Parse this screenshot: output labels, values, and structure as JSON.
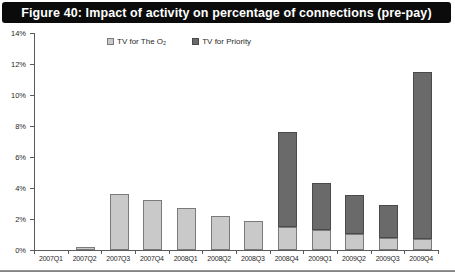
{
  "title": "Figure 40: Impact of activity on percentage of connections (pre-pay)",
  "chart_data": {
    "type": "bar",
    "stacked": true,
    "title": "Figure 40: Impact of activity on percentage of connections (pre-pay)",
    "categories": [
      "2007Q1",
      "2007Q2",
      "2007Q3",
      "2007Q4",
      "2008Q1",
      "2008Q2",
      "2008Q3",
      "2008Q4",
      "2009Q1",
      "2009Q2",
      "2009Q3",
      "2009Q4"
    ],
    "series": [
      {
        "name": "TV for The O₂",
        "color": "#c9c9c9",
        "border_color": "#7a7a7a",
        "values": [
          0,
          0.2,
          3.6,
          3.2,
          2.7,
          2.2,
          1.9,
          1.5,
          1.3,
          1.0,
          0.8,
          0.7
        ]
      },
      {
        "name": "TV for Priority",
        "color": "#6a6a6a",
        "border_color": "#4a4a4a",
        "values": [
          0,
          0,
          0,
          0,
          0,
          0,
          0,
          6.1,
          3.0,
          2.5,
          2.1,
          10.8
        ]
      }
    ],
    "stack_totals": [
      0,
      0.2,
      3.6,
      3.2,
      2.7,
      2.2,
      1.9,
      7.6,
      4.3,
      3.5,
      2.9,
      11.5
    ],
    "xlabel": "",
    "ylabel": "",
    "ylim": [
      0,
      14
    ],
    "ytick_step": 2,
    "ytick_labels": [
      "0%",
      "2%",
      "4%",
      "6%",
      "8%",
      "10%",
      "12%",
      "14%"
    ],
    "grid": false,
    "legend_position": "top-inside"
  }
}
